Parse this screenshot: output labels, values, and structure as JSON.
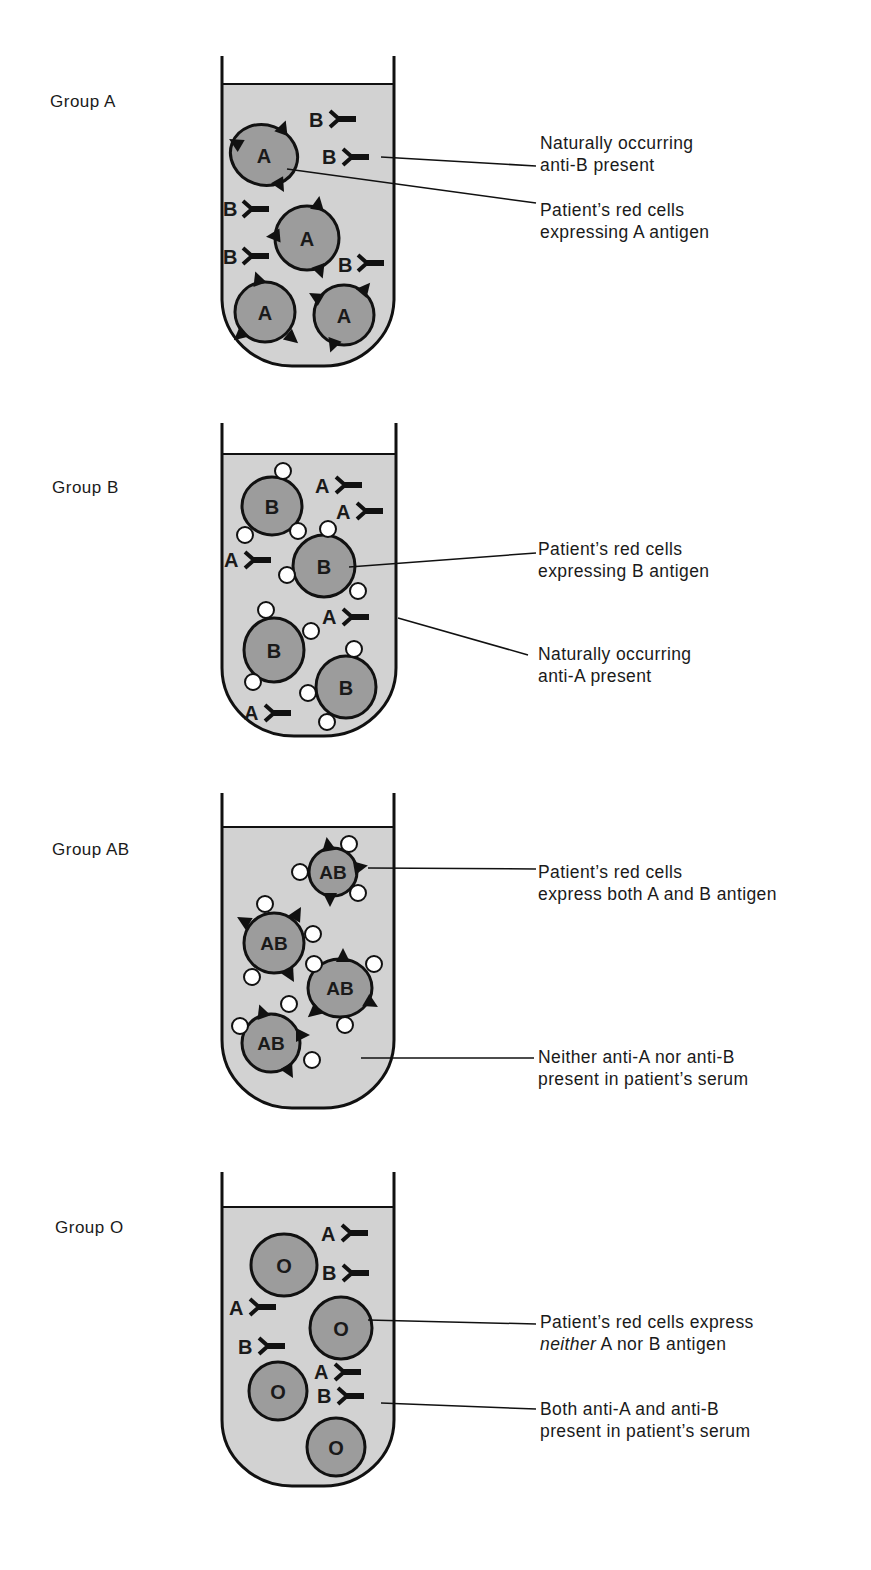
{
  "figure": {
    "top_caption_fragment": "group by",
    "colors": {
      "tube_fill": "#d2d2d2",
      "cell_fill": "#9c9c9c",
      "outline": "#111111",
      "background": "#ffffff"
    }
  },
  "groups": [
    {
      "label": "Group A",
      "callouts": [
        {
          "line1": "Naturally occurring",
          "line2": "anti-B present"
        },
        {
          "line1": "Patient’s red cells",
          "line2": "expressing A antigen"
        }
      ],
      "cells": [
        "A",
        "A",
        "A",
        "A"
      ],
      "antibodies": [
        "B",
        "B",
        "B",
        "B",
        "B"
      ]
    },
    {
      "label": "Group B",
      "callouts": [
        {
          "line1": "Patient’s red cells",
          "line2": "expressing B antigen"
        },
        {
          "line1": "Naturally occurring",
          "line2": "anti-A present"
        }
      ],
      "cells": [
        "B",
        "B",
        "B",
        "B"
      ],
      "antibodies": [
        "A",
        "A",
        "A",
        "A",
        "A"
      ]
    },
    {
      "label": "Group AB",
      "callouts": [
        {
          "line1": "Patient’s red cells",
          "line2": "express both A and B antigen"
        },
        {
          "line1": "Neither anti-A nor anti-B",
          "line2": "present in patient’s serum"
        }
      ],
      "cells": [
        "AB",
        "AB",
        "AB",
        "AB"
      ],
      "antibodies": []
    },
    {
      "label": "Group O",
      "callouts": [
        {
          "line1": "Patient’s red cells express",
          "line2_italic": "neither",
          "line2": " A nor B antigen"
        },
        {
          "line1": "Both anti-A and anti-B",
          "line2": "present in patient’s serum"
        }
      ],
      "cells": [
        "O",
        "O",
        "O",
        "O"
      ],
      "antibodies": [
        "A",
        "B",
        "A",
        "B",
        "A",
        "B"
      ]
    }
  ]
}
